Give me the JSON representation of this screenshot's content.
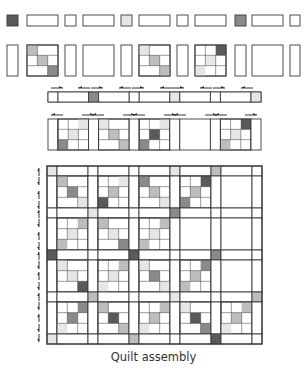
{
  "caption": "Quilt assembly",
  "colors": {
    "stroke": "#3a3a3a",
    "white": "#ffffff",
    "light": "#e6e6e6",
    "medium": "#bdbdbd",
    "dark": "#8a8a8a",
    "darkest": "#5a5a5a",
    "arrow": "#333333"
  },
  "exploded_sashing_row": {
    "y": 15,
    "h": 11,
    "pieces": [
      {
        "type": "corner",
        "x": 7,
        "w": 11,
        "fill": "darkest"
      },
      {
        "type": "strip",
        "x": 27,
        "w": 31,
        "fill": "white"
      },
      {
        "type": "corner",
        "x": 65,
        "w": 11,
        "fill": "white"
      },
      {
        "type": "strip",
        "x": 83,
        "w": 31,
        "fill": "white"
      },
      {
        "type": "corner",
        "x": 121,
        "w": 11,
        "fill": "light"
      },
      {
        "type": "strip",
        "x": 139,
        "w": 31,
        "fill": "white"
      },
      {
        "type": "corner",
        "x": 177,
        "w": 11,
        "fill": "white"
      },
      {
        "type": "strip",
        "x": 195,
        "w": 31,
        "fill": "white"
      },
      {
        "type": "corner",
        "x": 235,
        "w": 11,
        "fill": "dark"
      },
      {
        "type": "strip",
        "x": 252,
        "w": 31,
        "fill": "white"
      },
      {
        "type": "corner",
        "x": 290,
        "w": 10,
        "fill": "white"
      }
    ]
  },
  "exploded_block_row": {
    "y": 45,
    "h": 31,
    "pieces": [
      {
        "type": "sash",
        "x": 7,
        "w": 11
      },
      {
        "type": "block",
        "x": 27,
        "w": 31,
        "cells": [
          "medium",
          "white",
          "white",
          "white",
          "medium",
          "white",
          "white",
          "white",
          "dark"
        ]
      },
      {
        "type": "sash",
        "x": 65,
        "w": 11
      },
      {
        "type": "block",
        "x": 83,
        "w": 31,
        "cells": [
          "white",
          "white",
          "white",
          "white",
          "white",
          "white",
          "white",
          "white",
          "white"
        ],
        "plain": true
      },
      {
        "type": "sash",
        "x": 121,
        "w": 11
      },
      {
        "type": "block",
        "x": 139,
        "w": 31,
        "cells": [
          "light",
          "white",
          "white",
          "white",
          "medium",
          "white",
          "white",
          "white",
          "medium"
        ]
      },
      {
        "type": "sash",
        "x": 177,
        "w": 11
      },
      {
        "type": "block",
        "x": 195,
        "w": 31,
        "cells": [
          "white",
          "white",
          "darkest",
          "white",
          "light",
          "white",
          "light",
          "white",
          "white"
        ]
      },
      {
        "type": "sash",
        "x": 235,
        "w": 11
      },
      {
        "type": "block",
        "x": 252,
        "w": 31,
        "cells": [
          "white",
          "white",
          "white",
          "white",
          "white",
          "white",
          "white",
          "white",
          "white"
        ],
        "plain": true
      },
      {
        "type": "sash",
        "x": 290,
        "w": 10
      }
    ]
  },
  "sewn_sashing_row": {
    "x": 48,
    "y": 92,
    "w": 213,
    "h": 10,
    "corners": [
      {
        "fill": "white"
      },
      {
        "fill": "dark"
      },
      {
        "fill": "white"
      },
      {
        "fill": "light"
      },
      {
        "fill": "white"
      },
      {
        "fill": "light"
      }
    ],
    "arrows": [
      {
        "x": 57,
        "dir": "right"
      },
      {
        "x": 84,
        "dir": "left"
      },
      {
        "x": 97,
        "dir": "right"
      },
      {
        "x": 125,
        "dir": "left"
      },
      {
        "x": 138,
        "dir": "right"
      },
      {
        "x": 166,
        "dir": "left"
      },
      {
        "x": 178,
        "dir": "right"
      },
      {
        "x": 206,
        "dir": "left"
      },
      {
        "x": 219,
        "dir": "right"
      },
      {
        "x": 247,
        "dir": "left"
      }
    ]
  },
  "sewn_block_row": {
    "x": 48,
    "y": 119,
    "w": 213,
    "h": 31,
    "blocks": [
      {
        "cells": [
          "white",
          "white",
          "light",
          "white",
          "light",
          "white",
          "dark",
          "white",
          "white"
        ]
      },
      {
        "cells": [
          "light",
          "white",
          "white",
          "white",
          "medium",
          "white",
          "white",
          "white",
          "medium"
        ]
      },
      {
        "cells": [
          "white",
          "white",
          "light",
          "white",
          "darkest",
          "white",
          "dark",
          "white",
          "white"
        ]
      },
      {
        "cells": [
          "white",
          "white",
          "white",
          "white",
          "white",
          "white",
          "white",
          "white",
          "white"
        ],
        "plain": true
      },
      {
        "cells": [
          "white",
          "white",
          "darkest",
          "white",
          "light",
          "white",
          "medium",
          "white",
          "white"
        ]
      }
    ],
    "arrows": [
      {
        "x": 57,
        "dir": "left"
      },
      {
        "x": 88,
        "dir": "right"
      },
      {
        "x": 98,
        "dir": "left"
      },
      {
        "x": 129,
        "dir": "right"
      },
      {
        "x": 139,
        "dir": "left"
      },
      {
        "x": 170,
        "dir": "right"
      },
      {
        "x": 180,
        "dir": "left"
      },
      {
        "x": 211,
        "dir": "right"
      },
      {
        "x": 221,
        "dir": "left"
      },
      {
        "x": 251,
        "dir": "right"
      }
    ]
  },
  "assembled_quilt": {
    "x": 47,
    "y": 166,
    "sash": 10,
    "block": 31,
    "blockH": 32,
    "cols": 5,
    "rows": 4,
    "corners": [
      [
        "light",
        "white",
        "white",
        "light",
        "medium",
        "white"
      ],
      [
        "white",
        "light",
        "white",
        "dark",
        "white",
        "white"
      ],
      [
        "darkest",
        "white",
        "darkest",
        "white",
        "dark",
        "white"
      ],
      [
        "white",
        "medium",
        "white",
        "light",
        "white",
        "medium"
      ],
      [
        "light",
        "white",
        "medium",
        "white",
        "darkest",
        "white"
      ]
    ],
    "blocks": [
      [
        {
          "cells": [
            "medium",
            "white",
            "white",
            "white",
            "dark",
            "white",
            "white",
            "white",
            "light"
          ]
        },
        {
          "cells": [
            "white",
            "white",
            "light",
            "white",
            "medium",
            "white",
            "darkest",
            "white",
            "white"
          ]
        },
        {
          "cells": [
            "dark",
            "white",
            "white",
            "white",
            "medium",
            "white",
            "white",
            "white",
            "light"
          ]
        },
        {
          "cells": [
            "white",
            "white",
            "darkest",
            "white",
            "medium",
            "white",
            "dark",
            "white",
            "white"
          ]
        },
        {
          "cells": [
            "white",
            "white",
            "white",
            "white",
            "white",
            "white",
            "white",
            "white",
            "white"
          ],
          "plain": true
        }
      ],
      [
        {
          "cells": [
            "white",
            "white",
            "medium",
            "white",
            "light",
            "white",
            "medium",
            "white",
            "white"
          ]
        },
        {
          "cells": [
            "medium",
            "white",
            "white",
            "white",
            "light",
            "white",
            "white",
            "white",
            "dark"
          ]
        },
        {
          "cells": [
            "white",
            "white",
            "medium",
            "white",
            "light",
            "white",
            "medium",
            "white",
            "white"
          ]
        },
        {
          "cells": [
            "white",
            "white",
            "white",
            "white",
            "white",
            "white",
            "white",
            "white",
            "white"
          ],
          "plain": true
        },
        {
          "cells": [
            "white",
            "white",
            "white",
            "white",
            "white",
            "white",
            "white",
            "white",
            "white"
          ],
          "plain": true
        }
      ],
      [
        {
          "cells": [
            "light",
            "white",
            "white",
            "white",
            "light",
            "white",
            "white",
            "white",
            "darkest"
          ]
        },
        {
          "cells": [
            "white",
            "white",
            "medium",
            "white",
            "light",
            "white",
            "light",
            "white",
            "white"
          ]
        },
        {
          "cells": [
            "light",
            "white",
            "white",
            "white",
            "dark",
            "white",
            "white",
            "white",
            "light"
          ]
        },
        {
          "cells": [
            "white",
            "white",
            "dark",
            "white",
            "medium",
            "white",
            "medium",
            "white",
            "white"
          ]
        },
        {
          "cells": [
            "white",
            "white",
            "white",
            "white",
            "white",
            "white",
            "white",
            "white",
            "white"
          ],
          "plain": true
        }
      ],
      [
        {
          "cells": [
            "white",
            "white",
            "dark",
            "white",
            "dark",
            "white",
            "light",
            "white",
            "white"
          ]
        },
        {
          "cells": [
            "medium",
            "white",
            "white",
            "white",
            "darkest",
            "white",
            "white",
            "white",
            "medium"
          ]
        },
        {
          "cells": [
            "white",
            "white",
            "medium",
            "white",
            "medium",
            "white",
            "light",
            "white",
            "white"
          ]
        },
        {
          "cells": [
            "light",
            "white",
            "white",
            "white",
            "darkest",
            "white",
            "white",
            "white",
            "dark"
          ]
        },
        {
          "cells": [
            "white",
            "white",
            "medium",
            "white",
            "medium",
            "white",
            "light",
            "white",
            "white"
          ]
        }
      ]
    ],
    "left_arrows": [
      {
        "y": 172,
        "dir": "up"
      },
      {
        "y": 181,
        "dir": "down"
      },
      {
        "y": 195,
        "dir": "up"
      },
      {
        "y": 205,
        "dir": "down"
      },
      {
        "y": 214,
        "dir": "up"
      },
      {
        "y": 223,
        "dir": "down"
      },
      {
        "y": 236,
        "dir": "up"
      },
      {
        "y": 246,
        "dir": "down"
      },
      {
        "y": 256,
        "dir": "up"
      },
      {
        "y": 265,
        "dir": "down"
      },
      {
        "y": 276,
        "dir": "up"
      },
      {
        "y": 286,
        "dir": "down"
      },
      {
        "y": 297,
        "dir": "up"
      },
      {
        "y": 306,
        "dir": "down"
      },
      {
        "y": 318,
        "dir": "up"
      },
      {
        "y": 328,
        "dir": "down"
      },
      {
        "y": 338,
        "dir": "down"
      }
    ]
  }
}
